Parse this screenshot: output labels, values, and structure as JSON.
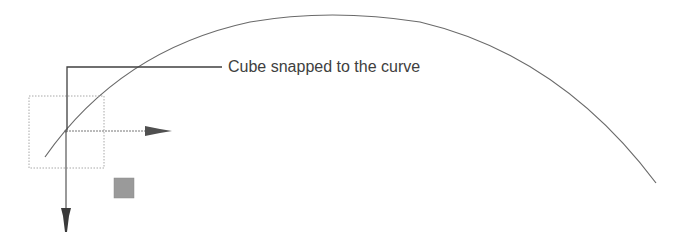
{
  "diagram": {
    "annotation": "Cube snapped to the curve",
    "elements": {
      "curve": {
        "description": "arc curve",
        "color": "#6a6a6a"
      },
      "leader_line": {
        "color": "#404040"
      },
      "bounding_box": {
        "style": "dotted",
        "color": "#a0a0a0"
      },
      "x_axis_arrow": {
        "direction": "right",
        "color": "#555555"
      },
      "y_axis_arrow": {
        "direction": "down",
        "color": "#444444"
      },
      "snap_square": {
        "color": "#9a9a9a"
      }
    }
  }
}
